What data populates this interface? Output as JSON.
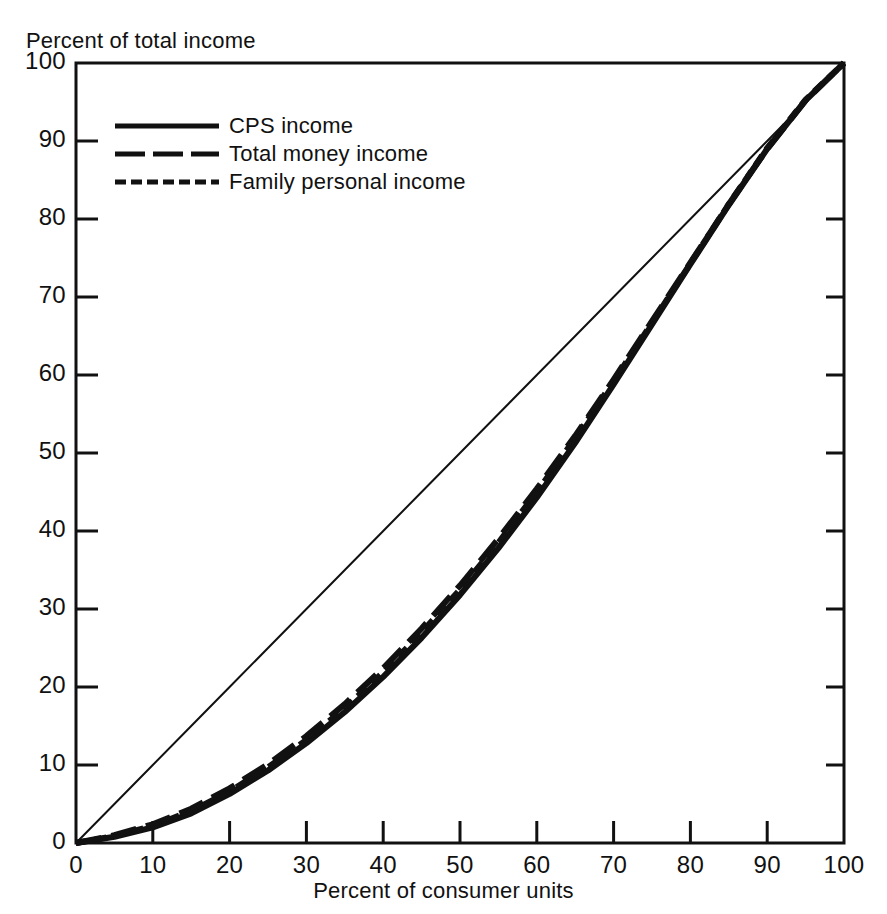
{
  "chart_data": {
    "type": "line",
    "title": "",
    "xlabel": "Percent of consumer units",
    "ylabel": "Percent of total income",
    "xlim": [
      0,
      100
    ],
    "ylim": [
      0,
      100
    ],
    "grid": false,
    "legend_position": "upper-left-inside",
    "x_ticks": [
      "0",
      "10",
      "20",
      "30",
      "40",
      "50",
      "60",
      "70",
      "80",
      "90",
      "100"
    ],
    "y_ticks": [
      "0",
      "10",
      "20",
      "30",
      "40",
      "50",
      "60",
      "70",
      "80",
      "90",
      "100"
    ],
    "x": [
      0,
      5,
      10,
      15,
      20,
      25,
      30,
      35,
      40,
      45,
      50,
      55,
      60,
      65,
      70,
      75,
      80,
      85,
      90,
      95,
      100
    ],
    "series": [
      {
        "name": "CPS income",
        "style": "solid",
        "color": "#111111",
        "values": [
          0.0,
          0.8,
          2.0,
          3.8,
          6.3,
          9.3,
          12.8,
          16.8,
          21.3,
          26.3,
          31.8,
          37.8,
          44.3,
          51.3,
          58.8,
          66.5,
          74.2,
          81.8,
          89.0,
          95.2,
          100.0
        ]
      },
      {
        "name": "Total money income",
        "style": "long-dash",
        "color": "#111111",
        "values": [
          0.0,
          1.0,
          2.4,
          4.4,
          7.0,
          10.1,
          13.7,
          17.8,
          22.4,
          27.5,
          33.0,
          39.0,
          45.4,
          52.2,
          59.4,
          66.9,
          74.4,
          81.9,
          89.0,
          95.2,
          100.0
        ]
      },
      {
        "name": "Family personal income",
        "style": "short-dash",
        "color": "#111111",
        "values": [
          0.0,
          0.9,
          2.2,
          4.1,
          6.6,
          9.7,
          13.2,
          17.3,
          21.9,
          27.0,
          32.5,
          38.5,
          45.0,
          51.9,
          59.2,
          66.7,
          74.3,
          81.9,
          89.1,
          95.3,
          100.0
        ]
      },
      {
        "name": "Line of equality",
        "style": "thin-solid",
        "color": "#111111",
        "values": [
          0,
          5,
          10,
          15,
          20,
          25,
          30,
          35,
          40,
          45,
          50,
          55,
          60,
          65,
          70,
          75,
          80,
          85,
          90,
          95,
          100
        ]
      }
    ]
  },
  "legend": {
    "items": [
      {
        "label": "CPS income",
        "style": "solid"
      },
      {
        "label": "Total money income",
        "style": "long-dash"
      },
      {
        "label": "Family personal income",
        "style": "short-dash"
      }
    ]
  },
  "axes": {
    "y_title": "Percent of total income",
    "x_title": "Percent of consumer units"
  }
}
